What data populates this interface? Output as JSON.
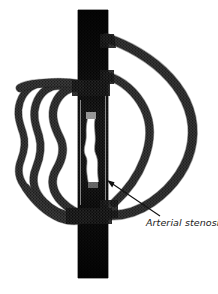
{
  "figure": {
    "background_color": "#ffffff",
    "vessel_fill_color": "#3a3a3a",
    "vessel_dark_color": "#141414",
    "vessel_outline_color": "#1a1a1a",
    "lumen_color": "#ffffff",
    "texture": "cross-hatch-stipple"
  },
  "annotation": {
    "label": "Arterial stenosis",
    "leader_line": {
      "from_x": 160,
      "from_y": 216,
      "to_x": 108,
      "to_y": 181,
      "arrowhead": "at-stenosis"
    }
  },
  "caption": {
    "text": ""
  },
  "anatomy": {
    "main_artery": {
      "name": "main-artery",
      "orientation": "vertical",
      "top_y": 10,
      "bottom_y": 278,
      "left_x": 78,
      "right_x": 108
    },
    "stenosis": {
      "name": "stenosis-lumen",
      "top_y": 119,
      "bottom_y": 182,
      "narrowest_width": 9,
      "description": "narrowed white lumen within the dark artery"
    },
    "collaterals": [
      {
        "id": "left-outer",
        "side": "left",
        "extent_x": 18
      },
      {
        "id": "left-middle",
        "side": "left",
        "extent_x": 38
      },
      {
        "id": "left-inner",
        "side": "left",
        "extent_x": 55
      },
      {
        "id": "right-outer",
        "side": "right",
        "extent_x": 196
      },
      {
        "id": "right-inner",
        "side": "right",
        "extent_x": 148
      }
    ]
  }
}
